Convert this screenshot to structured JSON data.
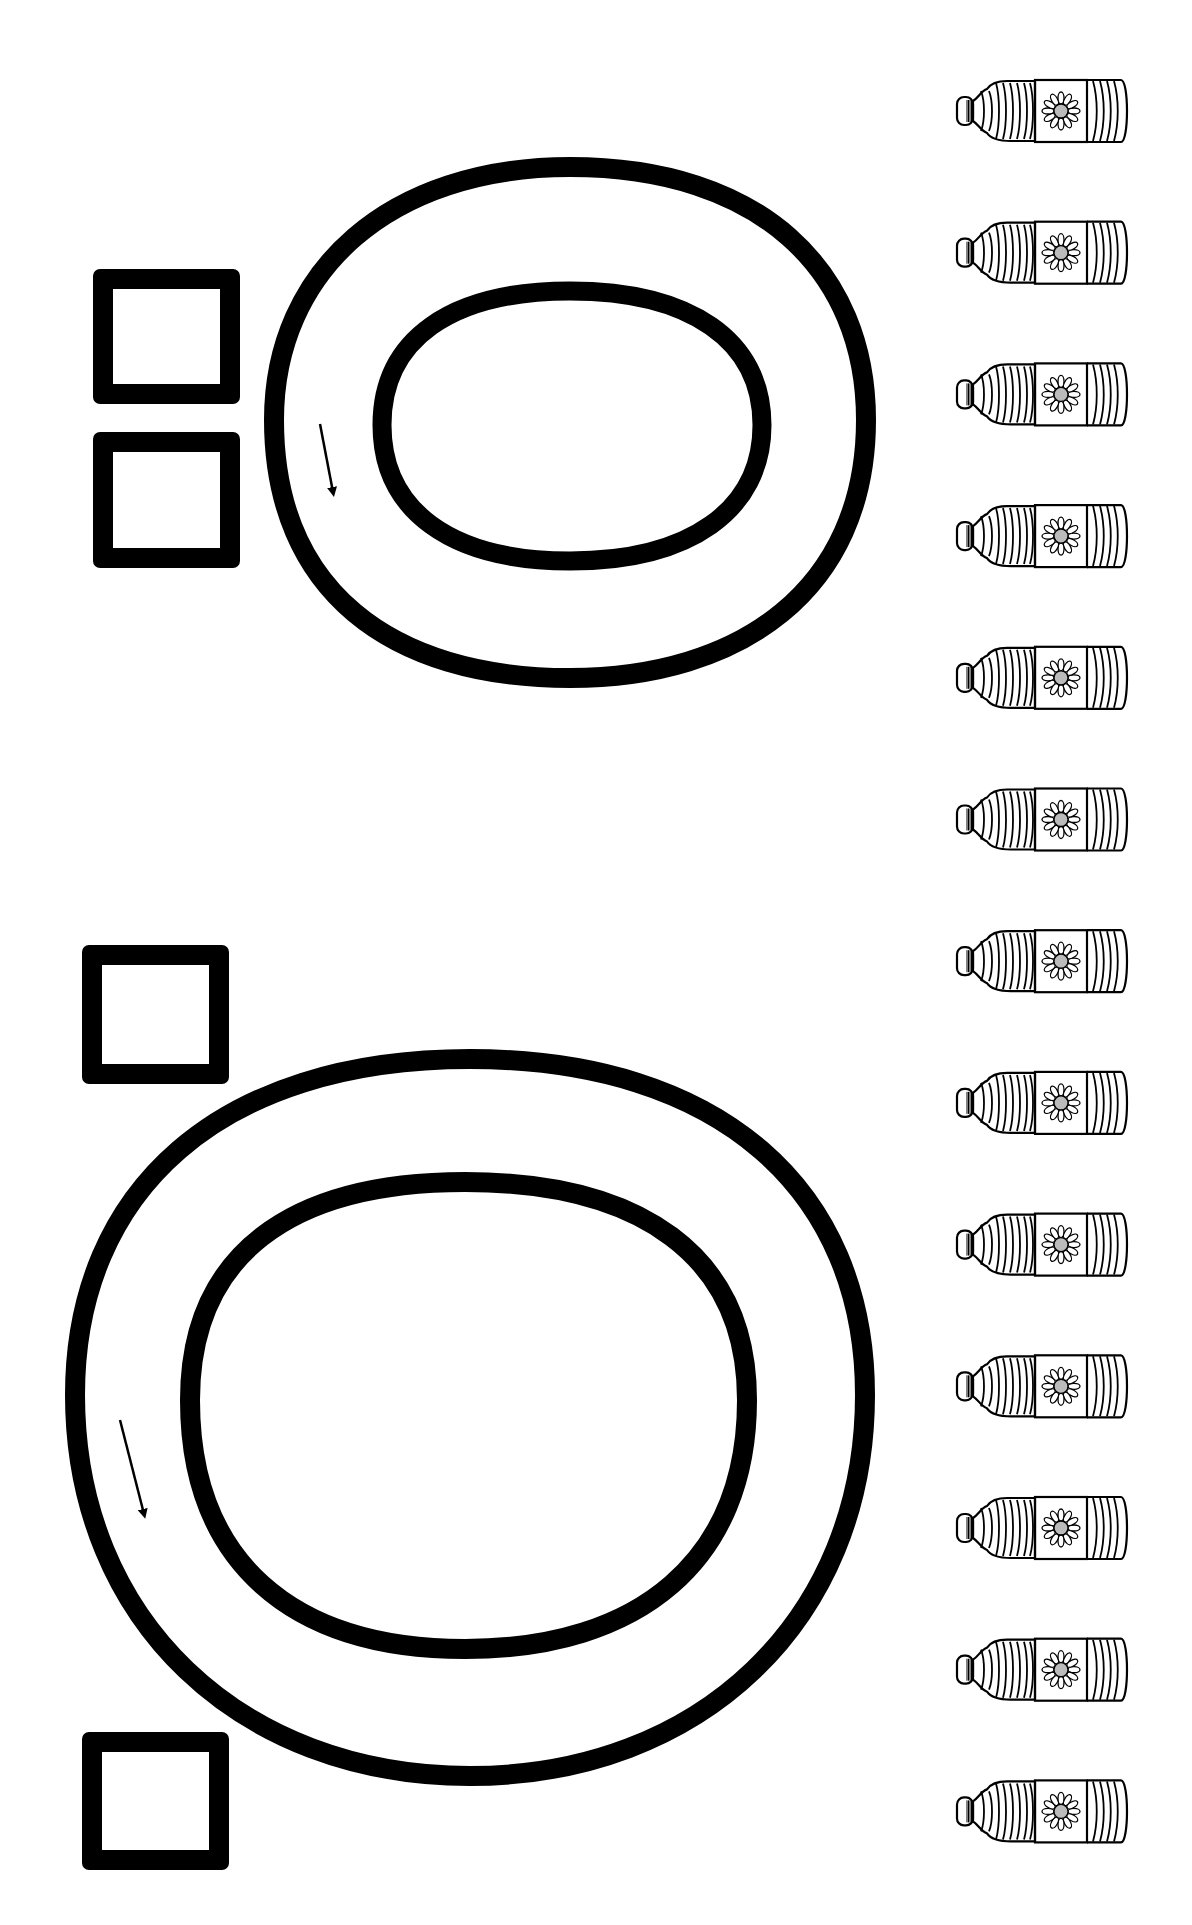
{
  "worksheet": {
    "title": "Letter O tracing and counting worksheet",
    "ink_color": "#000000",
    "paper_color": "#ffffff",
    "sections": [
      {
        "letter": "O",
        "case": "lowercase",
        "trace_direction": "counter-clockwise",
        "answer_boxes": 2
      },
      {
        "letter": "O",
        "case": "uppercase",
        "trace_direction": "counter-clockwise",
        "answer_boxes": 2
      }
    ],
    "counting_items": {
      "icon": "oil-bottle-icon",
      "decoration": "sunflower-label",
      "count": 13
    }
  }
}
